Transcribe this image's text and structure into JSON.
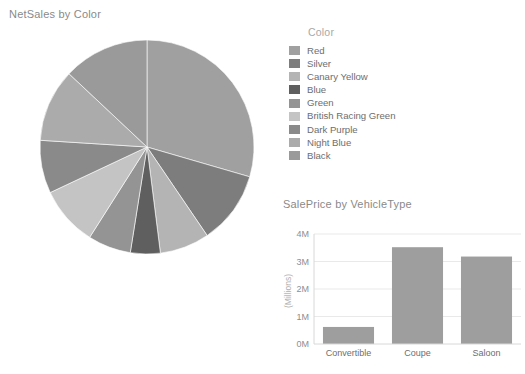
{
  "pie_card": {
    "title": "NetSales by Color"
  },
  "legend": {
    "title": "Color",
    "items": [
      {
        "label": "Red",
        "color": "#a0a0a0"
      },
      {
        "label": "Silver",
        "color": "#7d7d7d"
      },
      {
        "label": "Canary Yellow",
        "color": "#b4b4b4"
      },
      {
        "label": "Blue",
        "color": "#5f5f5f"
      },
      {
        "label": "Green",
        "color": "#949494"
      },
      {
        "label": "British Racing Green",
        "color": "#c4c4c4"
      },
      {
        "label": "Dark Purple",
        "color": "#8a8a8a"
      },
      {
        "label": "Night Blue",
        "color": "#ababab"
      },
      {
        "label": "Black",
        "color": "#9a9a9a"
      }
    ]
  },
  "bar_card": {
    "title": "SalePrice by VehicleType"
  },
  "chart_data": [
    {
      "type": "pie",
      "title": "NetSales by Color",
      "legend_title": "Color",
      "legend_position": "right",
      "categories": [
        "Red",
        "Silver",
        "Canary Yellow",
        "Blue",
        "Green",
        "British Racing Green",
        "Dark Purple",
        "Night Blue",
        "Black"
      ],
      "values": [
        29.5,
        11.0,
        7.5,
        4.5,
        6.5,
        9.0,
        8.0,
        11.0,
        13.0
      ],
      "value_unit": "percent",
      "colors": [
        "#a0a0a0",
        "#7d7d7d",
        "#b4b4b4",
        "#5f5f5f",
        "#949494",
        "#c4c4c4",
        "#8a8a8a",
        "#ababab",
        "#9a9a9a"
      ],
      "start_angle_deg": 0,
      "direction": "clockwise"
    },
    {
      "type": "bar",
      "title": "SalePrice by VehicleType",
      "categories": [
        "Convertible",
        "Coupe",
        "Saloon"
      ],
      "values": [
        0.62,
        3.52,
        3.18
      ],
      "xlabel": "",
      "ylabel": "(Millions)",
      "ylim": [
        0,
        4
      ],
      "ytick_labels": [
        "0M",
        "1M",
        "2M",
        "3M",
        "4M"
      ],
      "ytick_values": [
        0,
        1,
        2,
        3,
        4
      ],
      "grid": true,
      "bar_color": "#9e9e9e",
      "legend_position": "none"
    }
  ]
}
